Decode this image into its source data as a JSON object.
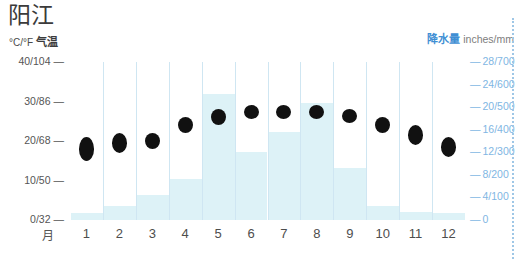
{
  "title": "阳江",
  "left_axis": {
    "caption_unit": "°C/°F",
    "caption_cn": "气温",
    "ticks": [
      "40/104",
      "30/86",
      "20/68",
      "10/50",
      "0/32"
    ],
    "dash": "—"
  },
  "right_axis": {
    "caption_cn": "降水量",
    "caption_unit": "inches/mm",
    "ticks": [
      "28/700",
      "24/600",
      "20/500",
      "16/400",
      "12/300",
      "8/200",
      "4/100",
      "0"
    ],
    "dash": "—"
  },
  "month_unit_label": "月",
  "colors": {
    "precip_bar": "#ddf2f7",
    "temp_marker": "#111111",
    "separator": "#cfe6f2",
    "right_axis_text": "#7fb6e3",
    "accent_blue": "#3f8fd4"
  },
  "chart_data": {
    "type": "bar",
    "title": "阳江",
    "xlabel": "月",
    "ylabel": "°C/°F 气温",
    "y2label": "降水量 inches/mm",
    "categories": [
      "1",
      "2",
      "3",
      "4",
      "5",
      "6",
      "7",
      "8",
      "9",
      "10",
      "11",
      "12"
    ],
    "ylim": [
      0,
      40
    ],
    "y2lim": [
      0,
      700
    ],
    "yticks": [
      0,
      10,
      20,
      30,
      40
    ],
    "ytick_labels": [
      "0/32",
      "10/50",
      "20/68",
      "30/86",
      "40/104"
    ],
    "y2ticks": [
      0,
      100,
      200,
      300,
      400,
      500,
      600,
      700
    ],
    "y2tick_labels": [
      "0",
      "4/100",
      "8/200",
      "12/300",
      "16/400",
      "20/500",
      "24/600",
      "28/700"
    ],
    "grid": false,
    "legend": "none",
    "series": [
      {
        "name": "降水量",
        "unit": "mm",
        "type": "bar",
        "axis": "right",
        "values": [
          30,
          60,
          110,
          180,
          560,
          300,
          390,
          520,
          230,
          60,
          35,
          30
        ]
      },
      {
        "name": "气温范围",
        "unit": "°C",
        "type": "range-marker",
        "axis": "left",
        "low": [
          15,
          17,
          18,
          22,
          24,
          26,
          26,
          26,
          25,
          22,
          19,
          16
        ],
        "high": [
          21,
          22,
          22,
          26,
          28,
          29,
          29,
          29,
          28,
          26,
          24,
          21
        ]
      }
    ]
  }
}
